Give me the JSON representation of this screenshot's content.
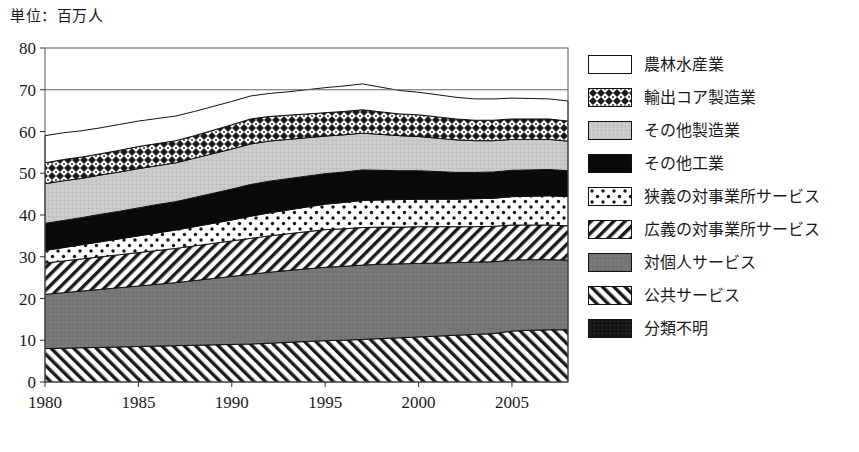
{
  "unit_note": "単位：百万人",
  "legend": {
    "items": [
      {
        "label": "農林水産業",
        "pattern": "blank"
      },
      {
        "label": "輸出コア製造業",
        "pattern": "checker"
      },
      {
        "label": "その他製造業",
        "pattern": "lightgray"
      },
      {
        "label": "その他工業",
        "pattern": "solidblack"
      },
      {
        "label": "狭義の対事業所サービス",
        "pattern": "dots"
      },
      {
        "label": "広義の対事業所サービス",
        "pattern": "diag-right"
      },
      {
        "label": "対個人サービス",
        "pattern": "midgray"
      },
      {
        "label": "公共サービス",
        "pattern": "diag-left"
      },
      {
        "label": "分類不明",
        "pattern": "darkblack"
      }
    ]
  },
  "chart_data": {
    "type": "area",
    "title": "",
    "xlabel": "",
    "ylabel": "",
    "unit": "単位：百万人",
    "stacked": true,
    "grid": false,
    "legend_position": "right",
    "xlim": [
      1980,
      2008
    ],
    "ylim": [
      0,
      80
    ],
    "yticks": [
      0,
      10,
      20,
      30,
      40,
      50,
      60,
      70,
      80
    ],
    "xticks": [
      1980,
      1985,
      1990,
      1995,
      2000,
      2005
    ],
    "x": [
      1980,
      1981,
      1982,
      1983,
      1984,
      1985,
      1986,
      1987,
      1988,
      1989,
      1990,
      1991,
      1992,
      1993,
      1994,
      1995,
      1996,
      1997,
      1998,
      1999,
      2000,
      2001,
      2002,
      2003,
      2004,
      2005,
      2006,
      2007,
      2008
    ],
    "series": [
      {
        "name": "公共サービス",
        "pattern": "diag-left",
        "values": [
          8.0,
          8.1,
          8.2,
          8.3,
          8.4,
          8.5,
          8.6,
          8.7,
          8.8,
          8.9,
          9.0,
          9.1,
          9.3,
          9.5,
          9.7,
          9.9,
          10.0,
          10.2,
          10.4,
          10.6,
          10.8,
          11.0,
          11.2,
          11.4,
          11.6,
          12.2,
          12.4,
          12.5,
          12.5
        ]
      },
      {
        "name": "対個人サービス",
        "pattern": "midgray",
        "values": [
          13.0,
          13.3,
          13.6,
          13.9,
          14.2,
          14.5,
          14.8,
          15.1,
          15.5,
          15.9,
          16.3,
          16.7,
          17.0,
          17.2,
          17.4,
          17.6,
          17.7,
          17.8,
          17.8,
          17.7,
          17.6,
          17.5,
          17.4,
          17.3,
          17.2,
          17.0,
          16.9,
          16.8,
          16.7
        ]
      },
      {
        "name": "広義の対事業所サービス",
        "pattern": "diag-right",
        "values": [
          7.5,
          7.6,
          7.7,
          7.8,
          7.9,
          8.0,
          8.1,
          8.2,
          8.3,
          8.4,
          8.5,
          8.6,
          8.7,
          8.8,
          8.9,
          9.0,
          9.0,
          9.0,
          8.9,
          8.8,
          8.8,
          8.7,
          8.6,
          8.5,
          8.5,
          8.4,
          8.3,
          8.3,
          8.2
        ]
      },
      {
        "name": "狭義の対事業所サービス",
        "pattern": "dots",
        "values": [
          3.0,
          3.2,
          3.4,
          3.6,
          3.8,
          4.0,
          4.2,
          4.4,
          4.6,
          4.8,
          5.0,
          5.3,
          5.5,
          5.7,
          5.9,
          6.1,
          6.3,
          6.5,
          6.5,
          6.6,
          6.6,
          6.6,
          6.6,
          6.7,
          6.7,
          6.8,
          6.9,
          7.0,
          7.0
        ]
      },
      {
        "name": "その他工業",
        "pattern": "solidblack",
        "values": [
          6.5,
          6.5,
          6.5,
          6.6,
          6.6,
          6.7,
          6.8,
          6.8,
          7.0,
          7.2,
          7.4,
          7.6,
          7.6,
          7.5,
          7.4,
          7.3,
          7.3,
          7.3,
          7.1,
          6.9,
          6.8,
          6.6,
          6.4,
          6.3,
          6.3,
          6.3,
          6.3,
          6.3,
          6.2
        ]
      },
      {
        "name": "その他製造業",
        "pattern": "lightgray",
        "values": [
          9.5,
          9.5,
          9.4,
          9.4,
          9.4,
          9.4,
          9.3,
          9.3,
          9.4,
          9.5,
          9.6,
          9.7,
          9.6,
          9.4,
          9.2,
          9.0,
          8.9,
          8.8,
          8.6,
          8.4,
          8.2,
          8.0,
          7.8,
          7.6,
          7.5,
          7.4,
          7.3,
          7.2,
          7.1
        ]
      },
      {
        "name": "輸出コア製造業",
        "pattern": "checker",
        "values": [
          5.0,
          5.1,
          5.1,
          5.1,
          5.2,
          5.3,
          5.3,
          5.3,
          5.4,
          5.6,
          5.8,
          6.0,
          5.9,
          5.8,
          5.7,
          5.6,
          5.6,
          5.6,
          5.4,
          5.2,
          5.2,
          5.1,
          5.0,
          4.9,
          4.9,
          4.9,
          4.9,
          4.9,
          4.8
        ]
      },
      {
        "name": "農林水産業",
        "pattern": "blank",
        "values": [
          6.5,
          6.4,
          6.3,
          6.2,
          6.2,
          6.1,
          6.0,
          5.9,
          5.8,
          5.7,
          5.6,
          5.5,
          5.5,
          5.6,
          5.8,
          6.0,
          6.1,
          6.2,
          5.9,
          5.6,
          5.4,
          5.3,
          5.2,
          5.1,
          5.1,
          5.0,
          4.9,
          4.8,
          4.8
        ]
      }
    ],
    "totals": [
      59.0,
      59.7,
      60.2,
      60.9,
      61.7,
      62.5,
      63.1,
      63.7,
      64.8,
      66.0,
      67.2,
      68.5,
      69.1,
      69.5,
      70.0,
      70.5,
      70.9,
      71.4,
      70.6,
      69.8,
      69.4,
      68.8,
      68.2,
      67.8,
      67.8,
      68.0,
      67.9,
      67.8,
      67.3
    ]
  }
}
